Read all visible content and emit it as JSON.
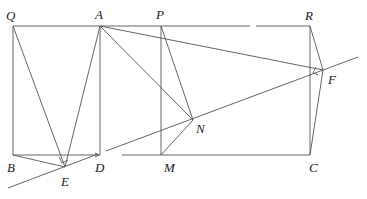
{
  "diagram": {
    "type": "geometry",
    "points": {
      "Q": {
        "label": "Q",
        "x": 13,
        "y": 26,
        "lx": 6,
        "ly": 20
      },
      "A": {
        "label": "A",
        "x": 100,
        "y": 26,
        "lx": 95,
        "ly": 19
      },
      "P": {
        "label": "P",
        "x": 161,
        "y": 26,
        "lx": 156,
        "ly": 19
      },
      "R": {
        "label": "R",
        "x": 310,
        "y": 26,
        "lx": 305,
        "ly": 20
      },
      "B": {
        "label": "B",
        "x": 13,
        "y": 155,
        "lx": 7,
        "ly": 172
      },
      "D": {
        "label": "D",
        "x": 100,
        "y": 155,
        "lx": 95,
        "ly": 172
      },
      "M": {
        "label": "M",
        "x": 161,
        "y": 155,
        "lx": 164,
        "ly": 172
      },
      "C": {
        "label": "C",
        "x": 310,
        "y": 155,
        "lx": 309,
        "ly": 172
      },
      "E": {
        "label": "E",
        "x": 65,
        "y": 167,
        "lx": 61,
        "ly": 186
      },
      "N": {
        "label": "N",
        "x": 193,
        "y": 120,
        "lx": 196,
        "ly": 133
      },
      "F": {
        "label": "F",
        "x": 323,
        "y": 70,
        "lx": 328,
        "ly": 84
      }
    },
    "labels": [
      "Q",
      "A",
      "P",
      "R",
      "B",
      "E",
      "D",
      "M",
      "N",
      "C",
      "F"
    ]
  }
}
